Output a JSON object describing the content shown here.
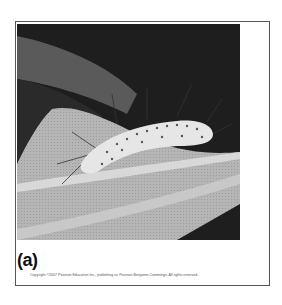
{
  "figure": {
    "panel_label": "(a)",
    "image_subject": "caterpillar-on-leaf-photo",
    "copyright": "Copyright ©2007 Pearson Education Inc., publishing as Pearson Benjamin Cummings. All rights reserved.",
    "colors": {
      "background": "#1e1e1e",
      "leaf_light": "#b9b9b9",
      "leaf_mid": "#8a8a8a",
      "caterpillar": "#e6e6e6",
      "frame_border": "#555555"
    }
  }
}
